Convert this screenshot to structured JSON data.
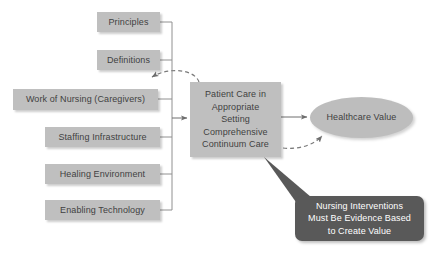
{
  "diagram": {
    "background_color": "#ffffff",
    "box_fill": "#bfbfbf",
    "box_text_color": "#3f3f3f",
    "callout_fill": "#595959",
    "callout_text_color": "#ffffff",
    "connector_color": "#808080",
    "inputs": [
      {
        "label": "Principles"
      },
      {
        "label": "Definitions"
      },
      {
        "label": "Work of Nursing (Caregivers)"
      },
      {
        "label": "Staffing Infrastructure"
      },
      {
        "label": "Healing Environment"
      },
      {
        "label": "Enabling Technology"
      }
    ],
    "center": {
      "lines": [
        "Patient Care in",
        "Appropriate",
        "Setting",
        "Comprehensive",
        "Continuum Care"
      ]
    },
    "outcome": {
      "label": "Healthcare Value"
    },
    "callout": {
      "lines": [
        "Nursing Interventions",
        "Must Be Evidence Based",
        "to Create Value"
      ]
    }
  }
}
